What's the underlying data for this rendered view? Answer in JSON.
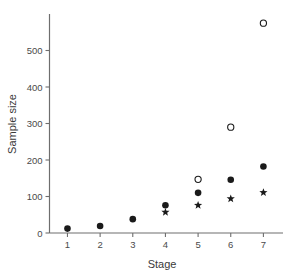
{
  "chart_data": {
    "type": "scatter",
    "title": "",
    "xlabel": "Stage",
    "ylabel": "Sample size",
    "categories": [
      "1",
      "2",
      "3",
      "4",
      "5",
      "6",
      "7"
    ],
    "x": [
      1,
      2,
      3,
      4,
      5,
      6,
      7
    ],
    "xlim": [
      0.45,
      7.6
    ],
    "ylim": [
      0,
      600
    ],
    "xticks": [
      "1",
      "2",
      "3",
      "4",
      "5",
      "6",
      "7"
    ],
    "yticks": [
      "0",
      "100",
      "200",
      "300",
      "400",
      "500"
    ],
    "ytick_values": [
      0,
      100,
      200,
      300,
      400,
      500
    ],
    "grid": false,
    "legend": "none",
    "series": [
      {
        "name": "open-circle",
        "marker": "open-circle",
        "color": "#1a1a1a",
        "points": [
          {
            "x": 5,
            "y": 147
          },
          {
            "x": 6,
            "y": 290
          },
          {
            "x": 7,
            "y": 575
          }
        ]
      },
      {
        "name": "filled-circle",
        "marker": "filled-circle",
        "color": "#1a1a1a",
        "points": [
          {
            "x": 1,
            "y": 12
          },
          {
            "x": 2,
            "y": 19
          },
          {
            "x": 3,
            "y": 38
          },
          {
            "x": 4,
            "y": 76
          },
          {
            "x": 5,
            "y": 110
          },
          {
            "x": 6,
            "y": 146
          },
          {
            "x": 7,
            "y": 182
          }
        ]
      },
      {
        "name": "star",
        "marker": "star",
        "color": "#1a1a1a",
        "points": [
          {
            "x": 4,
            "y": 57
          },
          {
            "x": 5,
            "y": 76
          },
          {
            "x": 6,
            "y": 94
          },
          {
            "x": 7,
            "y": 111
          }
        ]
      }
    ]
  },
  "axes": {
    "y_axis_title": "Sample size",
    "x_axis_title": "Stage"
  }
}
